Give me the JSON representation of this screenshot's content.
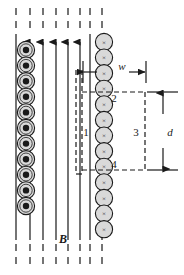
{
  "figure": {
    "background_color": "#ffffff",
    "ink_color": "#1a1a1a",
    "conductor_fill": "#d9d9d9"
  },
  "field": {
    "label": "B",
    "label_x": 63,
    "label_y": 243,
    "direction": "up",
    "line_color": "#3a3a3a",
    "lines_x": [
      16,
      30,
      43,
      56,
      68,
      80,
      90,
      102
    ],
    "line_top": 8,
    "line_bottom": 268,
    "solid_top": 42,
    "solid_bottom": 240,
    "arrow_tip_y": 42,
    "arrowed_lines_x": [
      30,
      43,
      56,
      68,
      80
    ]
  },
  "left_conductors": {
    "name": "current-out-of-page",
    "glyph": "dot",
    "x": 26,
    "radius": 8.6,
    "inner_radius": 3.2,
    "start_y": 50,
    "spacing": 15.6,
    "count": 11
  },
  "right_conductors": {
    "name": "current-into-page",
    "glyph": "x",
    "glyph_char": "×",
    "x": 104,
    "radius": 8.6,
    "start_y": 42,
    "spacing": 15.6,
    "count": 13
  },
  "amperian_loop": {
    "left_x": 82,
    "right_x": 145,
    "top_y": 92,
    "bottom_y": 170,
    "dash_pattern": "5,3",
    "side_labels": [
      {
        "id": "side-1",
        "text": "1",
        "x": 86,
        "y": 136
      },
      {
        "id": "side-2",
        "text": "2",
        "x": 114,
        "y": 102
      },
      {
        "id": "side-3",
        "text": "3",
        "x": 136,
        "y": 136
      },
      {
        "id": "side-4",
        "text": "4",
        "x": 114,
        "y": 168
      }
    ]
  },
  "dimensions": {
    "width_label": {
      "text": "w",
      "label_x": 122,
      "label_y": 70,
      "arrow_y": 72,
      "from_x": 83,
      "to_x": 146,
      "tick_top_y": 61,
      "tick_bottom_y": 83
    },
    "depth_label": {
      "text": "d",
      "label_x": 170,
      "label_y": 136,
      "arrow_x": 163,
      "from_y": 92,
      "to_y": 170,
      "tick_left_x": 147,
      "tick_right_x": 178
    }
  }
}
